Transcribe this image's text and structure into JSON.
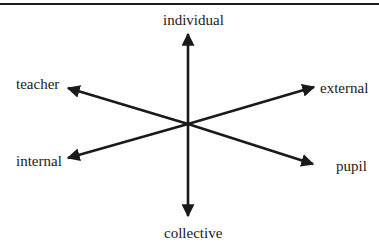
{
  "diagram": {
    "type": "axes-diagram",
    "center": {
      "x": 188,
      "y": 124
    },
    "colors": {
      "line": "#1a1a1a",
      "background": "#ffffff"
    },
    "axes": [
      {
        "name": "individual-collective",
        "positive": "individual",
        "negative": "collective"
      },
      {
        "name": "teacher-pupil",
        "positive": "teacher",
        "negative": "pupil"
      },
      {
        "name": "external-internal",
        "positive": "external",
        "negative": "internal"
      }
    ],
    "labels": {
      "individual": "individual",
      "collective": "collective",
      "teacher": "teacher",
      "pupil": "pupil",
      "external": "external",
      "internal": "internal"
    }
  }
}
